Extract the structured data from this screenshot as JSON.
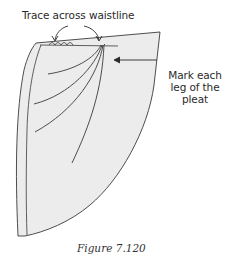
{
  "diagram": {
    "annotations": {
      "trace_label": "Trace across waistline",
      "mark_label_line1": "Mark each",
      "mark_label_line2": "leg of the",
      "mark_label_line3": "pleat"
    },
    "caption": "Figure 7.120",
    "colors": {
      "fill": "#ececec",
      "stroke": "#3a3a3a",
      "text": "#2a2a2a"
    },
    "icons": {
      "arrow_left": "curved-arrow-icon",
      "arrow_right": "curved-arrow-icon",
      "arrow_pointer": "arrow-left-icon"
    }
  }
}
